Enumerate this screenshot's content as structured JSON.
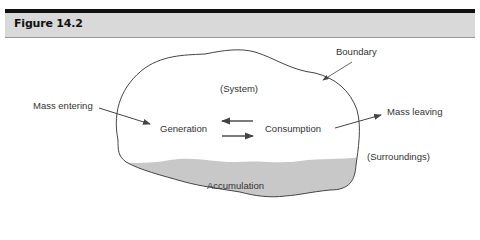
{
  "figure": {
    "title": "Figure 14.2"
  },
  "diagram": {
    "labels": {
      "boundary": "Boundary",
      "system": "(System)",
      "mass_entering": "Mass entering",
      "generation": "Generation",
      "consumption": "Consumption",
      "mass_leaving": "Mass leaving",
      "surroundings": "(Surroundings)",
      "accumulation": "Accumulation"
    },
    "colors": {
      "header_bg": "#d9d9d9",
      "accumulation_fill": "#c8c8c8",
      "line": "#444444"
    }
  }
}
